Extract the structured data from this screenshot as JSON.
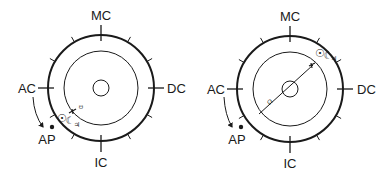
{
  "charts": [
    {
      "id": "chart-1",
      "center": [
        101,
        88
      ],
      "outer_radius": 53,
      "inner_radius": 37,
      "core_radius": 8,
      "angles": {
        "MC": "MC",
        "IC": "IC",
        "AC": "AC",
        "DC": "DC",
        "AP": "AP"
      },
      "symbols": {
        "sun": "☉",
        "moon": "☾",
        "jupiter": "♃",
        "node": "☋"
      }
    },
    {
      "id": "chart-2",
      "center": [
        290,
        89
      ],
      "outer_radius": 53,
      "inner_radius": 37,
      "core_radius": 8,
      "angles": {
        "MC": "MC",
        "IC": "IC",
        "AC": "AC",
        "DC": "DC",
        "AP": "AP"
      },
      "symbols": {
        "sun": "☉",
        "moon": "☾",
        "jupiter": "♃",
        "node": "☊"
      }
    }
  ],
  "colors": {
    "ink": "#1a1a1a",
    "background": "#ffffff"
  }
}
